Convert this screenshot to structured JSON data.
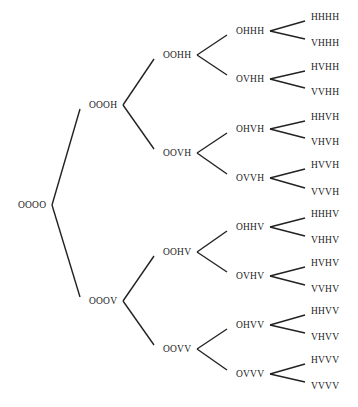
{
  "diagram": {
    "type": "binary tree",
    "root": {
      "label": "OOOO",
      "x": 18,
      "y": 205
    },
    "level1": [
      {
        "label": "OOOH",
        "x": 89,
        "y": 105
      },
      {
        "label": "OOOV",
        "x": 89,
        "y": 301
      }
    ],
    "level2": [
      {
        "label": "OOHH",
        "x": 163,
        "y": 55,
        "parent": 0
      },
      {
        "label": "OOVH",
        "x": 163,
        "y": 153,
        "parent": 0
      },
      {
        "label": "OOHV",
        "x": 163,
        "y": 252,
        "parent": 1
      },
      {
        "label": "OOVV",
        "x": 163,
        "y": 349,
        "parent": 1
      }
    ],
    "level3": [
      {
        "label": "OHHH",
        "x": 236,
        "y": 31,
        "parent": 0
      },
      {
        "label": "OVHH",
        "x": 236,
        "y": 79,
        "parent": 0
      },
      {
        "label": "OHVH",
        "x": 236,
        "y": 129,
        "parent": 1
      },
      {
        "label": "OVVH",
        "x": 236,
        "y": 178,
        "parent": 1
      },
      {
        "label": "OHHV",
        "x": 236,
        "y": 227,
        "parent": 2
      },
      {
        "label": "OVHV",
        "x": 236,
        "y": 276,
        "parent": 2
      },
      {
        "label": "OHVV",
        "x": 236,
        "y": 325,
        "parent": 3
      },
      {
        "label": "OVVV",
        "x": 236,
        "y": 374,
        "parent": 3
      }
    ],
    "leaves": [
      {
        "label": "HHHH",
        "x": 311,
        "y": 17,
        "parent": 0
      },
      {
        "label": "VHHH",
        "x": 311,
        "y": 43,
        "parent": 0
      },
      {
        "label": "HVHH",
        "x": 311,
        "y": 67,
        "parent": 1
      },
      {
        "label": "VVHH",
        "x": 311,
        "y": 92,
        "parent": 1
      },
      {
        "label": "HHVH",
        "x": 311,
        "y": 117,
        "parent": 2
      },
      {
        "label": "VHVH",
        "x": 311,
        "y": 142,
        "parent": 2
      },
      {
        "label": "HVVH",
        "x": 311,
        "y": 165,
        "parent": 3
      },
      {
        "label": "VVVH",
        "x": 311,
        "y": 192,
        "parent": 3
      },
      {
        "label": "HHHV",
        "x": 311,
        "y": 214,
        "parent": 4
      },
      {
        "label": "VHHV",
        "x": 311,
        "y": 240,
        "parent": 4
      },
      {
        "label": "HVHV",
        "x": 311,
        "y": 263,
        "parent": 5
      },
      {
        "label": "VVHV",
        "x": 311,
        "y": 289,
        "parent": 5
      },
      {
        "label": "HHVV",
        "x": 311,
        "y": 311,
        "parent": 6
      },
      {
        "label": "VHVV",
        "x": 311,
        "y": 337,
        "parent": 6
      },
      {
        "label": "HVVV",
        "x": 311,
        "y": 360,
        "parent": 7
      },
      {
        "label": "VVVV",
        "x": 311,
        "y": 386,
        "parent": 7
      }
    ],
    "line_color": "#222222"
  }
}
